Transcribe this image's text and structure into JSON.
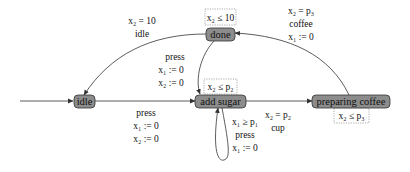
{
  "diagram": {
    "type": "timed-automaton",
    "nodes": {
      "idle": {
        "label": "idle",
        "initial": true
      },
      "add_sugar": {
        "label": "add sugar",
        "invariant": "x₂ ≤ p₂"
      },
      "preparing_coffee": {
        "label": "preparing coffee",
        "invariant": "x₂ ≤ p₃"
      },
      "done": {
        "label": "done",
        "invariant": "x₂ ≤ 10"
      }
    },
    "edges": {
      "idle_to_add_sugar": {
        "from": "idle",
        "to": "add sugar",
        "lines": [
          "press",
          "x₁ := 0",
          "x₂ := 0"
        ]
      },
      "add_sugar_self": {
        "from": "add sugar",
        "to": "add sugar",
        "lines": [
          "x₁ ≥ p₁",
          "press",
          "x₁ := 0"
        ]
      },
      "add_sugar_to_preparing": {
        "from": "add sugar",
        "to": "preparing coffee",
        "lines": [
          "x₂ = p₂",
          "cup"
        ]
      },
      "preparing_to_done": {
        "from": "preparing coffee",
        "to": "done",
        "lines": [
          "x₂ = p₃",
          "coffee",
          "x₁ := 0"
        ]
      },
      "done_to_add_sugar": {
        "from": "done",
        "to": "add sugar",
        "lines": [
          "press",
          "x₁ := 0",
          "x₂ := 0"
        ]
      },
      "done_to_idle": {
        "from": "done",
        "to": "idle",
        "lines": [
          "x₂ = 10",
          "idle"
        ]
      }
    },
    "colors": {
      "node_fill": "#8c8c8c",
      "node_stroke": "#333333",
      "edge": "#333333",
      "invariant_border": "#888888"
    }
  }
}
